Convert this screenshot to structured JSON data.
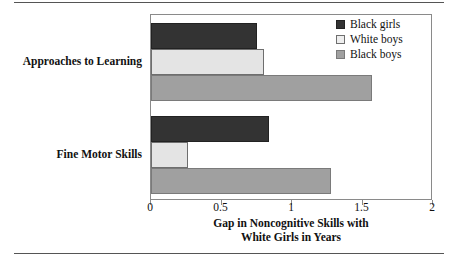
{
  "chart_data": {
    "type": "bar",
    "orientation": "horizontal",
    "title": "",
    "xlabel": "Gap in Noncognitive Skills with White Girls in Years",
    "xlabel_lines": [
      "Gap in Noncognitive Skills with",
      "White Girls in Years"
    ],
    "ylabel": "",
    "categories": [
      "Approaches to Learning",
      "Fine Motor Skills"
    ],
    "series": [
      {
        "name": "Black girls",
        "color": "#333333",
        "values": [
          0.75,
          0.84
        ]
      },
      {
        "name": "White boys",
        "color": "#e4e4e4",
        "values": [
          0.8,
          0.26
        ]
      },
      {
        "name": "Black boys",
        "color": "#a0a0a0",
        "values": [
          1.57,
          1.28
        ]
      }
    ],
    "xlim": [
      0,
      2
    ],
    "xticks": [
      0,
      0.5,
      1,
      1.5,
      2
    ],
    "xtick_labels": [
      "0",
      "0.5",
      "1",
      "1.5",
      "2"
    ],
    "grid": false,
    "legend_position": "top-right",
    "legend_entries": [
      "Black girls",
      "White boys",
      "Black boys"
    ]
  },
  "figure": {
    "rule_color": "#555555",
    "frame_color": "#8a8a8a"
  }
}
